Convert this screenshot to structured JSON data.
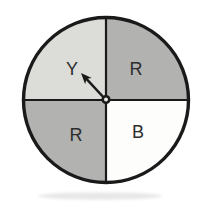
{
  "figure_type": "probability-spinner-diagram",
  "background_color": "#ffffff",
  "chart_data": {
    "type": "pie",
    "title": "",
    "legend": "none",
    "sectors": [
      {
        "label": "Y",
        "fraction": 0.25,
        "position": "top-left",
        "fill": "#dcdcd8"
      },
      {
        "label": "R",
        "fraction": 0.25,
        "position": "top-right",
        "fill": "#b2b2b0"
      },
      {
        "label": "R",
        "fraction": 0.25,
        "position": "bottom-left",
        "fill": "#b2b2b0"
      },
      {
        "label": "B",
        "fraction": 0.25,
        "position": "bottom-right",
        "fill": "#fdfdfc"
      }
    ]
  },
  "spinner": {
    "center_x": 106,
    "center_y": 100,
    "radius": 82.5,
    "outline_color": "#1a1a1a",
    "outline_width": 3.4,
    "divider_width": 2.2,
    "label_color": "#2d2d2d",
    "label_font_size": 18,
    "labels": [
      {
        "text": "Y",
        "x": 72,
        "y": 69
      },
      {
        "text": "R",
        "x": 136,
        "y": 69
      },
      {
        "text": "R",
        "x": 76,
        "y": 135
      },
      {
        "text": "B",
        "x": 138,
        "y": 132
      }
    ],
    "arrow": {
      "from_x": 106,
      "from_y": 100,
      "to_x": 81,
      "to_y": 73,
      "width": 2.5,
      "head_len": 11,
      "head_w": 9,
      "color": "#1a1a1a"
    },
    "pivot": {
      "x": 106,
      "y": 99.5,
      "r": 3.3,
      "ring_width": 2.6,
      "hole_fill": "#e9e9e7"
    },
    "shadow": {
      "cx": 100,
      "cy": 196,
      "rx": 62,
      "ry": 3.5,
      "fill": "#c9c9c9",
      "opacity": 0.45
    }
  }
}
